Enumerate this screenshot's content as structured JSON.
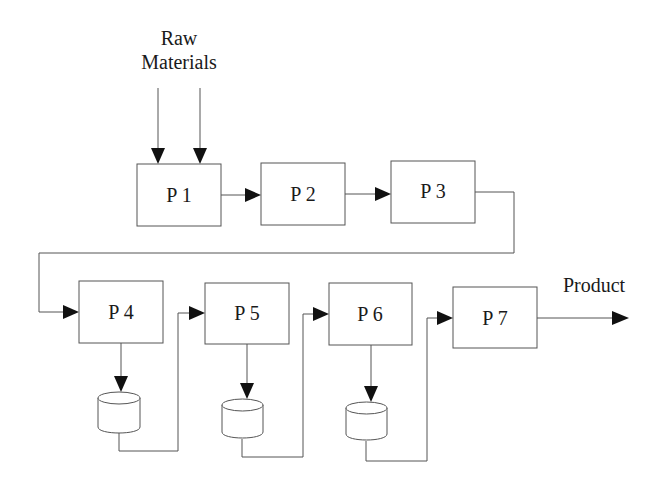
{
  "diagram": {
    "type": "process-flow",
    "input_label_line1": "Raw",
    "input_label_line2": "Materials",
    "output_label": "Product",
    "processes": [
      {
        "id": "P1",
        "label": "P 1"
      },
      {
        "id": "P2",
        "label": "P 2"
      },
      {
        "id": "P3",
        "label": "P 3"
      },
      {
        "id": "P4",
        "label": "P 4"
      },
      {
        "id": "P5",
        "label": "P 5"
      },
      {
        "id": "P6",
        "label": "P 6"
      },
      {
        "id": "P7",
        "label": "P 7"
      }
    ],
    "storage": [
      {
        "id": "S4",
        "attached_to": "P4"
      },
      {
        "id": "S5",
        "attached_to": "P5"
      },
      {
        "id": "S6",
        "attached_to": "P6"
      }
    ],
    "edges": [
      {
        "from": "Raw Materials",
        "to": "P1",
        "count": 2
      },
      {
        "from": "P1",
        "to": "P2"
      },
      {
        "from": "P2",
        "to": "P3"
      },
      {
        "from": "P3",
        "to": "P4"
      },
      {
        "from": "P4",
        "to": "S4"
      },
      {
        "from": "S4",
        "to": "P5"
      },
      {
        "from": "P5",
        "to": "S5"
      },
      {
        "from": "S5",
        "to": "P6"
      },
      {
        "from": "P6",
        "to": "S6"
      },
      {
        "from": "S6",
        "to": "P7"
      },
      {
        "from": "P7",
        "to": "Product"
      }
    ],
    "colors": {
      "line": "#555555",
      "arrowhead": "#111111",
      "background": "#ffffff"
    }
  }
}
